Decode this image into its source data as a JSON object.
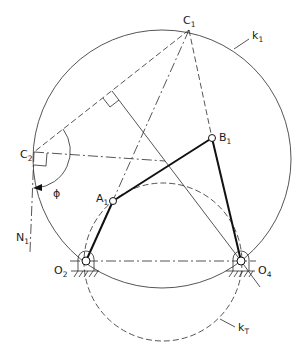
{
  "figure": {
    "type": "four-bar linkage construction",
    "labels": {
      "C1": "C",
      "C1_sub": "1",
      "C2": "C",
      "C2_sub": "2",
      "B1": "B",
      "B1_sub": "1",
      "A1": "A",
      "A1_sub": "1",
      "O2": "O",
      "O2_sub": "2",
      "O4": "O",
      "O4_sub": "4",
      "N1": "N",
      "N1_sub": "1",
      "k1": "k",
      "k1_sub": "1",
      "kT": "k",
      "kT_sub": "T",
      "phi": "ϕ"
    },
    "points": {
      "C1": [
        189,
        30
      ],
      "C2": [
        34,
        152
      ],
      "B1": [
        212,
        138
      ],
      "A1": [
        113,
        201
      ],
      "O2": [
        86,
        261
      ],
      "O4": [
        241,
        261
      ]
    },
    "circles": {
      "k1": {
        "center": [
          162,
          159
        ],
        "r": 129,
        "style": "solid"
      },
      "kT": {
        "center": [
          163,
          262
        ],
        "r": 79,
        "style": "dashed"
      }
    },
    "colors": {
      "line": "#2a2a2a",
      "background": "#ffffff"
    }
  }
}
